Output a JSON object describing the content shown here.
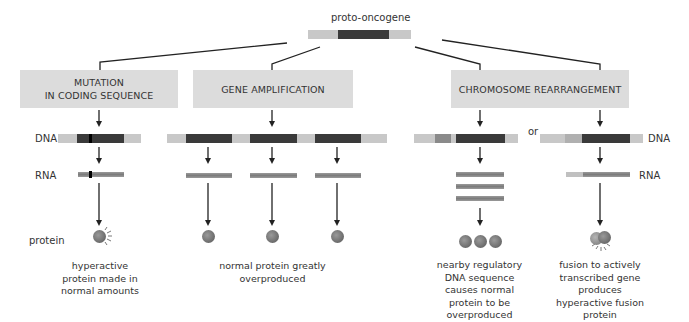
{
  "title": "proto-oncogene",
  "row_labels": {
    "dna_left": "DNA",
    "rna_left": "RNA",
    "protein": "protein",
    "dna_right": "DNA",
    "rna_right": "RNA"
  },
  "or_label": "or",
  "boxes": [
    {
      "label_line1": "MUTATION",
      "label_line2": "IN CODING SEQUENCE"
    },
    {
      "label_line1": "GENE AMPLIFICATION"
    },
    {
      "label_line1": "CHROMOSOME REARRANGEMENT"
    }
  ],
  "captions": {
    "mutation": "hyperactive protein made in normal amounts",
    "amplification": "normal protein greatly overproduced",
    "rearrangement_regulatory": "nearby regulatory DNA sequence causes normal protein to be overproduced",
    "rearrangement_fusion": "fusion to actively transcribed gene produces hyperactive fusion protein"
  },
  "colors": {
    "flank": "#c8c8c8",
    "coding": "#3a3a3a",
    "regulatory": "#8a8a8a",
    "fusion_partner": "#b5b5b5",
    "box": "#dcdcdc",
    "line": "#222222"
  }
}
